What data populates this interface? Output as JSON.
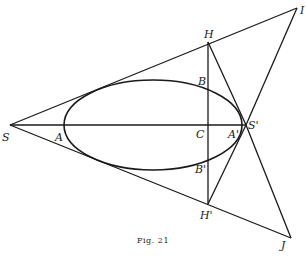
{
  "figure": {
    "caption": "Fig. 21",
    "labels": {
      "S": "S",
      "A": "A",
      "C": "C",
      "A_prime": "A'",
      "S_prime": "S'",
      "H": "H",
      "H_prime": "H'",
      "B": "B",
      "B_prime": "B'",
      "I": "I",
      "J": "J"
    }
  }
}
